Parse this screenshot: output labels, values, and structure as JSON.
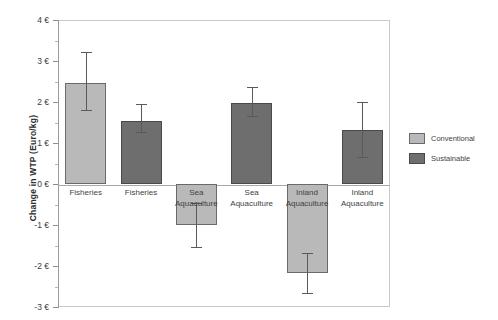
{
  "chart_data": {
    "type": "bar",
    "title": "",
    "subtitle": "",
    "xlabel": "",
    "ylabel": "Change in WTP (Euro/kg)",
    "ylim": [
      -3,
      4
    ],
    "grid": false,
    "legend_position": "right",
    "y_ticks": [
      {
        "value": 4,
        "label": "4 €"
      },
      {
        "value": 3,
        "label": "3 €"
      },
      {
        "value": 2,
        "label": "2 €"
      },
      {
        "value": 1,
        "label": "1 €"
      },
      {
        "value": 0,
        "label": "0 €"
      },
      {
        "value": -1,
        "label": "-1 €"
      },
      {
        "value": -2,
        "label": "-2 €"
      },
      {
        "value": -3,
        "label": "-3 €"
      }
    ],
    "y_minor_ticks": [
      3.5,
      2.5,
      1.5,
      0.5,
      -0.5,
      -1.5,
      -2.5
    ],
    "categories": [
      "Fisheries",
      "Fisheries",
      "Sea\nAquaculture",
      "Sea\nAquaculture",
      "Inland\nAquaculture",
      "Inland\nAquaculture"
    ],
    "legend": [
      {
        "name": "Conventional",
        "color": "#b9b9b9"
      },
      {
        "name": "Sustainable",
        "color": "#6e6e6e"
      }
    ],
    "bars": [
      {
        "category": "Fisheries",
        "series": "Conventional",
        "value": 2.47,
        "err_low": 1.8,
        "err_high": 3.22
      },
      {
        "category": "Fisheries",
        "series": "Sustainable",
        "value": 1.54,
        "err_low": 1.27,
        "err_high": 1.95
      },
      {
        "category": "Sea Aquaculture",
        "series": "Conventional",
        "value": -1.01,
        "err_low": -1.53,
        "err_high": -0.47
      },
      {
        "category": "Sea Aquaculture",
        "series": "Sustainable",
        "value": 1.98,
        "err_low": 1.66,
        "err_high": 2.37
      },
      {
        "category": "Inland Aquaculture",
        "series": "Conventional",
        "value": -2.17,
        "err_low": -2.67,
        "err_high": -1.68
      },
      {
        "category": "Inland Aquaculture",
        "series": "Sustainable",
        "value": 1.32,
        "err_low": 0.66,
        "err_high": 2.0
      }
    ]
  }
}
